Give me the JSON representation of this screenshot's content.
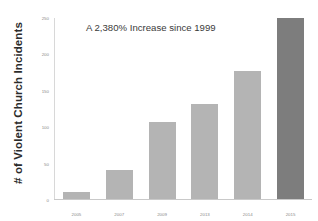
{
  "chart_data": {
    "type": "bar",
    "title": "",
    "annotation": "A 2,380% Increase since 1999",
    "xlabel": "",
    "ylabel": "# of Violent Church Incidents",
    "categories": [
      "2005",
      "2007",
      "2009",
      "2013",
      "2014",
      "2015"
    ],
    "values": [
      10,
      40,
      107,
      131,
      177,
      250
    ],
    "ylim": [
      0,
      250
    ],
    "yticks": [
      "0",
      "50",
      "100",
      "150",
      "200",
      "250"
    ],
    "ytick_values": [
      0,
      50,
      100,
      150,
      200,
      250
    ],
    "grid": false,
    "legend": null,
    "bar_colors": [
      "#b4b4b4",
      "#b4b4b4",
      "#b4b4b4",
      "#b4b4b4",
      "#b4b4b4",
      "#7d7d7d"
    ],
    "colors": {
      "background": "#ffffff",
      "bar_light": "#b4b4b4",
      "bar_dark": "#7d7d7d",
      "axis": "#c9c9c9",
      "tick_text": "#8a8a8a",
      "title_text": "#3a3a3a",
      "axis_title_text": "#2b2b2b"
    }
  }
}
